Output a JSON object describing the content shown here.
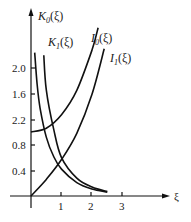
{
  "chart_data": {
    "type": "line",
    "title": "",
    "xlabel": "ξ",
    "ylabel": "",
    "xlim": [
      0,
      3.5
    ],
    "ylim": [
      0,
      2.8
    ],
    "grid": false,
    "legend_position": "inline labels at curve tops",
    "x_ticks": [
      "1",
      "2",
      "3"
    ],
    "y_ticks": [
      "0.4",
      "0.8",
      "2.2",
      "1.6",
      "2.0"
    ],
    "series": [
      {
        "name": "K0(ξ)",
        "label_main": "K",
        "label_sub": "0",
        "label_arg": "(ξ)",
        "x": [
          0.12,
          0.2,
          0.3,
          0.5,
          0.75,
          1.0,
          1.5,
          2.0,
          2.5
        ],
        "values": [
          2.24,
          1.75,
          1.37,
          0.92,
          0.61,
          0.42,
          0.21,
          0.11,
          0.06
        ]
      },
      {
        "name": "K1(ξ)",
        "label_main": "K",
        "label_sub": "1",
        "label_arg": "(ξ)",
        "x": [
          0.42,
          0.5,
          0.75,
          1.0,
          1.5,
          2.0,
          2.5
        ],
        "values": [
          2.2,
          1.66,
          1.03,
          0.6,
          0.28,
          0.14,
          0.07
        ]
      },
      {
        "name": "I0(ξ)",
        "label_main": "I",
        "label_sub": "0",
        "label_arg": "(ξ)",
        "x": [
          0.0,
          0.5,
          1.0,
          1.5,
          2.0,
          2.2
        ],
        "values": [
          1.0,
          1.06,
          1.27,
          1.65,
          2.28,
          2.63
        ]
      },
      {
        "name": "I1(ξ)",
        "label_main": "I",
        "label_sub": "1",
        "label_arg": "(ξ)",
        "x": [
          0.0,
          0.5,
          1.0,
          1.5,
          2.0,
          2.4
        ],
        "values": [
          0.0,
          0.26,
          0.57,
          0.98,
          1.59,
          2.3
        ]
      }
    ]
  }
}
